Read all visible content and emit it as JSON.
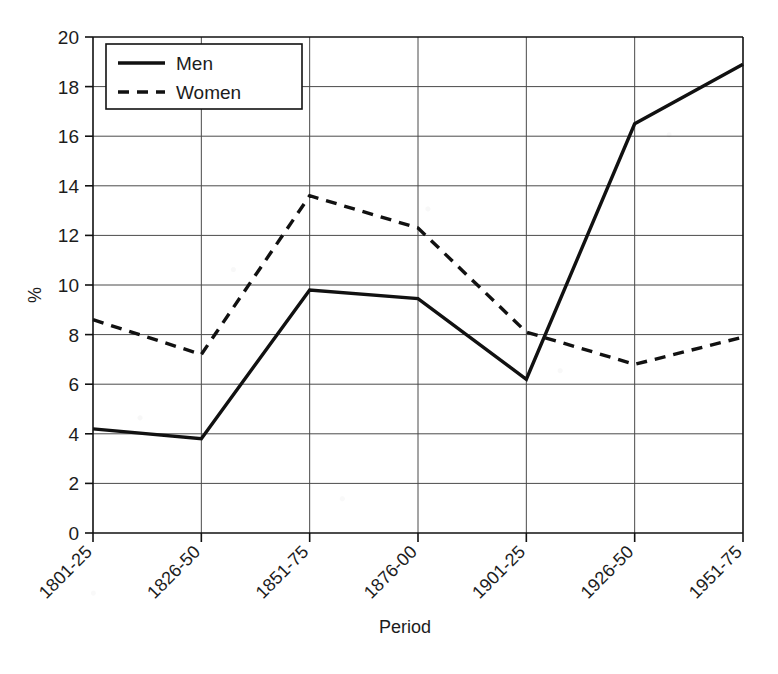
{
  "chart_data": {
    "type": "line",
    "title": "",
    "xlabel": "Period",
    "ylabel": "%",
    "categories": [
      "1801-25",
      "1826-50",
      "1851-75",
      "1876-00",
      "1901-25",
      "1926-50",
      "1951-75"
    ],
    "series": [
      {
        "name": "Men",
        "style": "solid",
        "values": [
          4.2,
          3.8,
          9.8,
          9.45,
          6.2,
          16.5,
          18.9
        ]
      },
      {
        "name": "Women",
        "style": "dashed",
        "values": [
          8.6,
          7.2,
          13.6,
          12.3,
          8.1,
          6.8,
          7.9
        ]
      }
    ],
    "ylim": [
      0,
      20
    ],
    "ytick_step": 2,
    "yticks": [
      "0",
      "2",
      "4",
      "6",
      "8",
      "10",
      "12",
      "14",
      "16",
      "18",
      "20"
    ],
    "grid": "horizontal-and-vertical",
    "legend_position": "top-left-inside",
    "xtick_rotation": "-45",
    "line_color": "#111111",
    "grid_color": "#4a4a4a",
    "background_color": "#ffffff"
  },
  "legend": {
    "entries": [
      {
        "label": "Men"
      },
      {
        "label": "Women"
      }
    ]
  },
  "axes": {
    "y_axis_title": "%",
    "x_axis_title": "Period"
  }
}
